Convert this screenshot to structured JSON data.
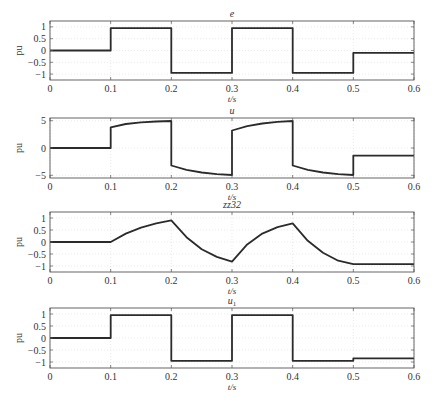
{
  "chart_data": [
    {
      "type": "line",
      "title": "e",
      "xlabel": "t/s",
      "ylabel": "pu",
      "xlim": [
        0,
        0.6
      ],
      "ylim": [
        -1.25,
        1.25
      ],
      "xticks": [
        "0",
        "0.1",
        "0.2",
        "0.3",
        "0.4",
        "0.5",
        "0.6"
      ],
      "yticks": [
        "1",
        "0.5",
        "0",
        "-0.5",
        "-1"
      ],
      "ytick_values": [
        1,
        0.5,
        0,
        -0.5,
        -1
      ],
      "grid": true,
      "x": [
        0,
        0.1,
        0.1,
        0.2,
        0.2,
        0.3,
        0.3,
        0.4,
        0.4,
        0.5,
        0.5,
        0.6
      ],
      "y": [
        0,
        0,
        0.95,
        0.95,
        -0.95,
        -0.95,
        0.95,
        0.95,
        -0.95,
        -0.95,
        -0.1,
        -0.1
      ]
    },
    {
      "type": "line",
      "title": "u",
      "xlabel": "t/s",
      "ylabel": "pu",
      "xlim": [
        0,
        0.6
      ],
      "ylim": [
        -5.5,
        5.5
      ],
      "xticks": [
        "0",
        "0.1",
        "0.2",
        "0.3",
        "0.4",
        "0.5",
        "0.6"
      ],
      "yticks": [
        "5",
        "0",
        "-5"
      ],
      "ytick_values": [
        5,
        0,
        -5
      ],
      "grid": true,
      "x": [
        0,
        0.1,
        0.1,
        0.125,
        0.15,
        0.175,
        0.2,
        0.2,
        0.225,
        0.25,
        0.275,
        0.3,
        0.3,
        0.325,
        0.35,
        0.375,
        0.4,
        0.4,
        0.425,
        0.45,
        0.475,
        0.5,
        0.5,
        0.6
      ],
      "y": [
        0,
        0,
        3.8,
        4.4,
        4.7,
        4.85,
        4.95,
        -3.2,
        -4.0,
        -4.5,
        -4.8,
        -4.95,
        3.2,
        4.0,
        4.5,
        4.8,
        4.95,
        -3.2,
        -4.0,
        -4.5,
        -4.8,
        -4.95,
        -1.4,
        -1.4
      ]
    },
    {
      "type": "line",
      "title": "zz32",
      "xlabel": "t/s",
      "ylabel": "pu",
      "xlim": [
        0,
        0.6
      ],
      "ylim": [
        -1.25,
        1.25
      ],
      "xticks": [
        "0",
        "0.1",
        "0.2",
        "0.3",
        "0.4",
        "0.5",
        "0.6"
      ],
      "yticks": [
        "1",
        "0.5",
        "0",
        "-0.5",
        "-1"
      ],
      "ytick_values": [
        1,
        0.5,
        0,
        -0.5,
        -1
      ],
      "grid": true,
      "x": [
        0,
        0.1,
        0.125,
        0.15,
        0.175,
        0.2,
        0.225,
        0.25,
        0.275,
        0.3,
        0.325,
        0.35,
        0.375,
        0.4,
        0.425,
        0.45,
        0.475,
        0.5,
        0.6
      ],
      "y": [
        0,
        0,
        0.35,
        0.6,
        0.78,
        0.9,
        0.2,
        -0.3,
        -0.62,
        -0.82,
        -0.1,
        0.35,
        0.62,
        0.78,
        0.05,
        -0.45,
        -0.78,
        -0.92,
        -0.92
      ]
    },
    {
      "type": "line",
      "title": "u1",
      "xlabel": "t/s",
      "ylabel": "pu",
      "xlim": [
        0,
        0.6
      ],
      "ylim": [
        -1.25,
        1.25
      ],
      "xticks": [
        "0",
        "0.1",
        "0.2",
        "0.3",
        "0.4",
        "0.5",
        "0.6"
      ],
      "yticks": [
        "1",
        "0.5",
        "0",
        "-0.5",
        "-1"
      ],
      "ytick_values": [
        1,
        0.5,
        0,
        -0.5,
        -1
      ],
      "grid": true,
      "x": [
        0,
        0.1,
        0.1,
        0.2,
        0.2,
        0.3,
        0.3,
        0.4,
        0.4,
        0.5,
        0.5,
        0.6
      ],
      "y": [
        0,
        0,
        0.95,
        0.95,
        -0.95,
        -0.95,
        0.95,
        0.95,
        -0.95,
        -0.95,
        -0.85,
        -0.85
      ]
    }
  ],
  "colors": {
    "line": "#2b2b2b",
    "axes": "#555555",
    "grid": "#dcdcdc"
  }
}
